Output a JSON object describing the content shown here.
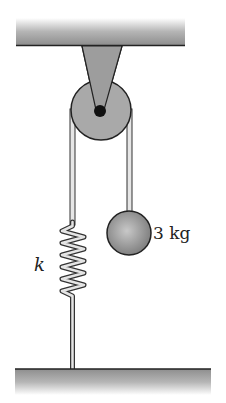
{
  "diagram": {
    "type": "physics-pulley-spring-mass",
    "mass_label": "3 kg",
    "spring_label": "k",
    "colors": {
      "surface": "#9a9a9a",
      "pulley": "#a8a8a8",
      "axle": "#111111",
      "ball": "#8c8c8c",
      "outline": "#222222"
    },
    "elements": [
      {
        "name": "ceiling",
        "description": "Shaded ceiling beam at top"
      },
      {
        "name": "pulley-bracket",
        "description": "Triangular bracket attaching pulley to ceiling"
      },
      {
        "name": "pulley",
        "description": "Circular pulley wheel with black axle"
      },
      {
        "name": "rope-left",
        "description": "Rope on left side descending to spring"
      },
      {
        "name": "spring",
        "description": "Coiled spring with constant k"
      },
      {
        "name": "rope-right",
        "description": "Rope on right side holding mass"
      },
      {
        "name": "mass",
        "description": "Spherical 3 kg mass"
      },
      {
        "name": "floor",
        "description": "Shaded floor at bottom anchoring the spring"
      }
    ]
  }
}
